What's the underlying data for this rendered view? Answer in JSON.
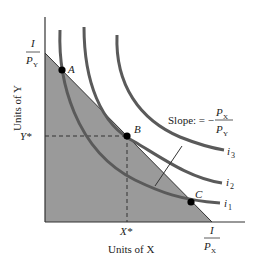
{
  "diagram": {
    "colors": {
      "feasible_region": "#9a9a9a",
      "curves": "#5a5a5a",
      "axes": "#333333",
      "text": "#222222",
      "points": "#000000"
    },
    "axes": {
      "x_label": "Units of X",
      "y_label": "Units of Y",
      "x_intercept_num": "I",
      "x_intercept_den": "P",
      "x_intercept_sub": "X",
      "y_intercept_num": "I",
      "y_intercept_den": "P",
      "y_intercept_sub": "Y",
      "x_star": "X*",
      "y_star": "Y*"
    },
    "points": [
      {
        "label": "A"
      },
      {
        "label": "B"
      },
      {
        "label": "C"
      }
    ],
    "curves": [
      {
        "label": "i",
        "sub": "1"
      },
      {
        "label": "i",
        "sub": "2"
      },
      {
        "label": "i",
        "sub": "3"
      }
    ],
    "slope_annotation": {
      "prefix": "Slope: = −",
      "num": "P",
      "num_sub": "X",
      "den": "P",
      "den_sub": "Y"
    }
  }
}
